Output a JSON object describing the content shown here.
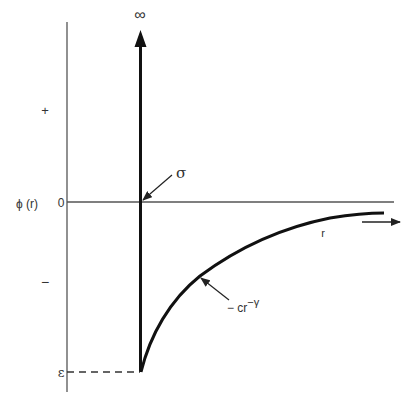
{
  "diagram": {
    "y_axis": {
      "label": "ϕ (r)",
      "plus_label": "+",
      "zero_label": "0",
      "minus_label": "−",
      "epsilon_label": "ε"
    },
    "x_axis": {
      "label": "r"
    },
    "annotations": {
      "infinity": "∞",
      "sigma": "σ",
      "curve_formula_base": "− cr",
      "curve_formula_exp": "−γ"
    },
    "colors": {
      "axis": "#555555",
      "curve": "#111111",
      "text": "#333333"
    }
  }
}
